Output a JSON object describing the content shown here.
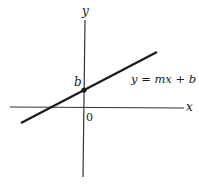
{
  "diagram": {
    "axes": {
      "x_label": "x",
      "y_label": "y",
      "origin_label": "0"
    },
    "line": {
      "equation_label": "y = mx + b",
      "intercept_label": "b"
    },
    "colors": {
      "ink": "#1a1a1a",
      "axis": "#333333",
      "background": "#ffffff"
    }
  }
}
